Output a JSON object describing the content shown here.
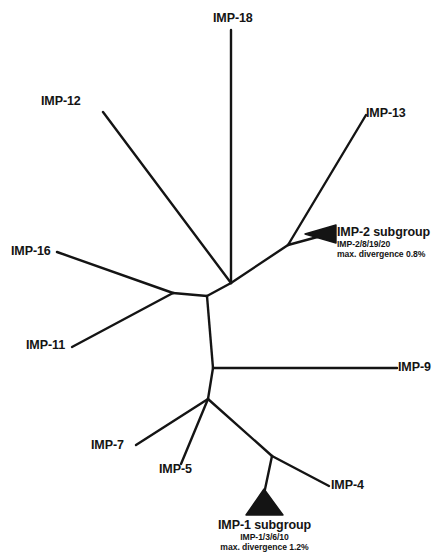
{
  "figure": {
    "type": "unrooted-phylogenetic-tree",
    "background_color": "#ffffff",
    "line_color": "#141414",
    "text_color": "#141414"
  },
  "tips": [
    {
      "id": "imp-18",
      "label": "IMP-18",
      "x": 213,
      "y": 12
    },
    {
      "id": "imp-12",
      "label": "IMP-12",
      "x": 41,
      "y": 95
    },
    {
      "id": "imp-13",
      "label": "IMP-13",
      "x": 366,
      "y": 107
    },
    {
      "id": "imp-16",
      "label": "IMP-16",
      "x": 11,
      "y": 245
    },
    {
      "id": "imp-11",
      "label": "IMP-11",
      "x": 26,
      "y": 339
    },
    {
      "id": "imp-9",
      "label": "IMP-9",
      "x": 398,
      "y": 361
    },
    {
      "id": "imp-7",
      "label": "IMP-7",
      "x": 91,
      "y": 439
    },
    {
      "id": "imp-5",
      "label": "IMP-5",
      "x": 159,
      "y": 463
    },
    {
      "id": "imp-4",
      "label": "IMP-4",
      "x": 331,
      "y": 479
    }
  ],
  "clades": [
    {
      "id": "imp-2-subgroup",
      "title": "IMP-2 subgroup",
      "members": "IMP-2/8/19/20",
      "divergence": "max. divergence 0.8%",
      "x": 337,
      "y": 225,
      "align": "left",
      "wedge_direction": "left"
    },
    {
      "id": "imp-1-subgroup",
      "title": "IMP-1 subgroup",
      "members": "IMP-1/3/6/10",
      "divergence": "max. divergence 1.2%",
      "x": 196,
      "y": 518,
      "align": "center",
      "wedge_direction": "up"
    }
  ],
  "branches": [
    {
      "id": "branch-imp-18",
      "from": "hub",
      "to": "imp-18",
      "path": "M 231,30 L 231,283"
    },
    {
      "id": "branch-hub-upper",
      "from": "hub",
      "to": "upper-node",
      "path": "M 207,296 L 231,283"
    },
    {
      "id": "branch-imp-12",
      "from": "upper-node",
      "to": "imp-12",
      "path": "M 231,283 L 103,112"
    },
    {
      "id": "branch-imp-13-node",
      "from": "hub",
      "to": "imp13-node",
      "path": "M 231,283 L 288,245"
    },
    {
      "id": "branch-imp-13",
      "from": "imp13-node",
      "to": "imp-13",
      "path": "M 288,245 L 366,115"
    },
    {
      "id": "branch-imp-2-stem",
      "from": "imp13-node",
      "to": "imp-2-wedge",
      "path": "M 288,245 L 331,233"
    },
    {
      "id": "branch-hub-left",
      "from": "hub",
      "to": "left-node",
      "path": "M 207,296 L 173,293"
    },
    {
      "id": "branch-imp-16",
      "from": "left-node",
      "to": "imp-16",
      "path": "M 173,293 L 57,252"
    },
    {
      "id": "branch-imp-11",
      "from": "left-node",
      "to": "imp-11",
      "path": "M 173,293 L 72,347"
    },
    {
      "id": "branch-hub-lower",
      "from": "hub",
      "to": "lower-node",
      "path": "M 207,296 L 213,368"
    },
    {
      "id": "branch-imp-9",
      "from": "lower-node",
      "to": "imp-9",
      "path": "M 213,368 L 397,368"
    },
    {
      "id": "branch-lower-bottom",
      "from": "lower-node",
      "to": "bottom-node",
      "path": "M 213,368 L 208,399"
    },
    {
      "id": "branch-imp-7",
      "from": "bottom-node",
      "to": "imp-7",
      "path": "M 208,399 L 136,445"
    },
    {
      "id": "branch-imp-5",
      "from": "bottom-node",
      "to": "imp-5",
      "path": "M 208,399 L 181,464"
    },
    {
      "id": "branch-bottom-split",
      "from": "bottom-node",
      "to": "split-node",
      "path": "M 208,399 L 272,456"
    },
    {
      "id": "branch-imp-4",
      "from": "split-node",
      "to": "imp-4",
      "path": "M 272,456 L 329,486"
    },
    {
      "id": "branch-imp-1-stem",
      "from": "split-node",
      "to": "imp-1-wedge",
      "path": "M 272,456 L 263,497"
    }
  ]
}
